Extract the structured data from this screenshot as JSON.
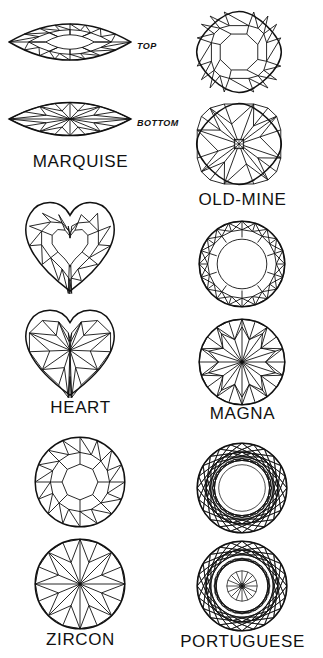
{
  "page": {
    "background_color": "#ffffff",
    "line_color": "#111111",
    "width": 323,
    "height": 658
  },
  "view_labels": {
    "top": "TOP",
    "bottom": "BOTTOM"
  },
  "columns": [
    {
      "name": "left-column",
      "gems": [
        {
          "id": "marquise",
          "label": "MARQUISE",
          "shape": "marquise",
          "views": [
            {
              "view": "top",
              "view_label": "TOP",
              "x": 6,
              "y": 6,
              "w": 128,
              "h": 72
            },
            {
              "view": "bottom",
              "view_label": "BOTTOM",
              "x": 6,
              "y": 86,
              "w": 128,
              "h": 66
            }
          ],
          "label_y": 152
        },
        {
          "id": "heart",
          "label": "HEART",
          "shape": "heart",
          "views": [
            {
              "view": "top",
              "view_label": "",
              "x": 22,
              "y": 196,
              "w": 96,
              "h": 98
            },
            {
              "view": "bottom",
              "view_label": "",
              "x": 22,
              "y": 304,
              "w": 96,
              "h": 94
            }
          ],
          "label_y": 398
        },
        {
          "id": "zircon",
          "label": "ZIRCON",
          "shape": "round-zircon",
          "views": [
            {
              "view": "top",
              "view_label": "",
              "x": 34,
              "y": 436,
              "w": 92,
              "h": 92
            },
            {
              "view": "bottom",
              "view_label": "",
              "x": 34,
              "y": 538,
              "w": 92,
              "h": 92
            }
          ],
          "label_y": 630
        }
      ]
    },
    {
      "name": "right-column",
      "gems": [
        {
          "id": "old-mine",
          "label": "OLD-MINE",
          "shape": "cushion",
          "views": [
            {
              "view": "top",
              "view_label": "",
              "x": 31,
              "y": 8,
              "w": 92,
              "h": 88
            },
            {
              "view": "bottom",
              "view_label": "",
              "x": 31,
              "y": 100,
              "w": 92,
              "h": 88
            }
          ],
          "label_y": 190
        },
        {
          "id": "magna",
          "label": "MAGNA",
          "shape": "round-magna",
          "views": [
            {
              "view": "top",
              "view_label": "",
              "x": 36,
              "y": 220,
              "w": 88,
              "h": 88
            },
            {
              "view": "bottom",
              "view_label": "",
              "x": 36,
              "y": 318,
              "w": 88,
              "h": 88
            }
          ],
          "label_y": 404
        },
        {
          "id": "portuguese",
          "label": "PORTUGUESE",
          "shape": "round-portuguese",
          "views": [
            {
              "view": "top",
              "view_label": "",
              "x": 34,
              "y": 442,
              "w": 92,
              "h": 92
            },
            {
              "view": "bottom",
              "view_label": "",
              "x": 34,
              "y": 540,
              "w": 92,
              "h": 92
            }
          ],
          "label_y": 632
        }
      ]
    }
  ]
}
